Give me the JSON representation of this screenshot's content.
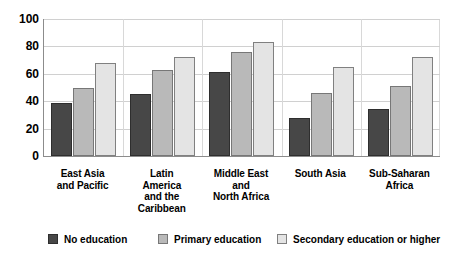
{
  "chart_data": {
    "type": "bar",
    "title": "",
    "subtitle": "",
    "xlabel": "",
    "ylabel": "",
    "ylim": [
      0,
      100
    ],
    "yticks": [
      0,
      20,
      40,
      60,
      80,
      100
    ],
    "ytick_labels": [
      "0",
      "20",
      "40",
      "60",
      "80",
      "100"
    ],
    "grid": true,
    "legend_position": "bottom",
    "categories": [
      "East Asia and Pacific",
      "Latin America and the Caribbean",
      "Middle East and North Africa",
      "South Asia",
      "Sub-Saharan Africa"
    ],
    "category_label_lines": [
      [
        "East Asia",
        "and Pacific"
      ],
      [
        "Latin",
        "America",
        "and the",
        "Caribbean"
      ],
      [
        "Middle East",
        "and",
        "North Africa"
      ],
      [
        "South Asia"
      ],
      [
        "Sub-Saharan",
        "Africa"
      ]
    ],
    "series": [
      {
        "name": "No education",
        "color": "#474747",
        "values": [
          39,
          45,
          61,
          28,
          34
        ]
      },
      {
        "name": "Primary education",
        "color": "#b9b9b9",
        "values": [
          50,
          63,
          76,
          46,
          51
        ]
      },
      {
        "name": "Secondary education or higher",
        "color": "#e4e4e4",
        "values": [
          68,
          72,
          83,
          65,
          72
        ]
      }
    ]
  },
  "legend": {
    "items": [
      {
        "label": "No education",
        "swatch": "series-0-swatch"
      },
      {
        "label": "Primary education",
        "swatch": "series-1-swatch"
      },
      {
        "label": "Secondary education or higher",
        "swatch": "series-2-swatch"
      }
    ]
  },
  "colors": {
    "series_0": "#474747",
    "series_1": "#b9b9b9",
    "series_2": "#e4e4e4",
    "axis": "#8c8c8c",
    "gridline": "#d0d0d0",
    "background": "#ffffff",
    "text": "#000000"
  }
}
